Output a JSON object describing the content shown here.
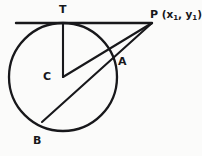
{
  "figure": {
    "type": "circle-tangent-secant-diagram",
    "background_color": "#fbfbfa",
    "stroke_color": "#18181b",
    "labels": {
      "tangent_point": "T",
      "center": "C",
      "near_intersection": "A",
      "far_intersection": "B",
      "external_point": "P",
      "external_point_coords_open": "(x",
      "external_point_coords_sub1": "1",
      "external_point_coords_mid": ", y",
      "external_point_coords_sub2": "1",
      "external_point_coords_close": ")"
    },
    "geometry": {
      "circle": {
        "cx": 63,
        "cy": 77,
        "r": 54
      },
      "points": {
        "T": {
          "x": 63,
          "y": 23
        },
        "C": {
          "x": 63,
          "y": 77
        },
        "A": {
          "x": 113,
          "y": 58
        },
        "B": {
          "x": 42,
          "y": 122
        },
        "P": {
          "x": 152,
          "y": 23
        }
      },
      "segments": [
        {
          "name": "tangent-line",
          "from": [
            16,
            23
          ],
          "to": [
            152,
            23
          ]
        },
        {
          "name": "radius-CT",
          "from": [
            63,
            23
          ],
          "to": [
            63,
            77
          ]
        },
        {
          "name": "segment-CP",
          "from": [
            63,
            77
          ],
          "to": [
            152,
            23
          ]
        },
        {
          "name": "secant-BP",
          "from": [
            42,
            122
          ],
          "to": [
            152,
            23
          ]
        }
      ]
    }
  }
}
